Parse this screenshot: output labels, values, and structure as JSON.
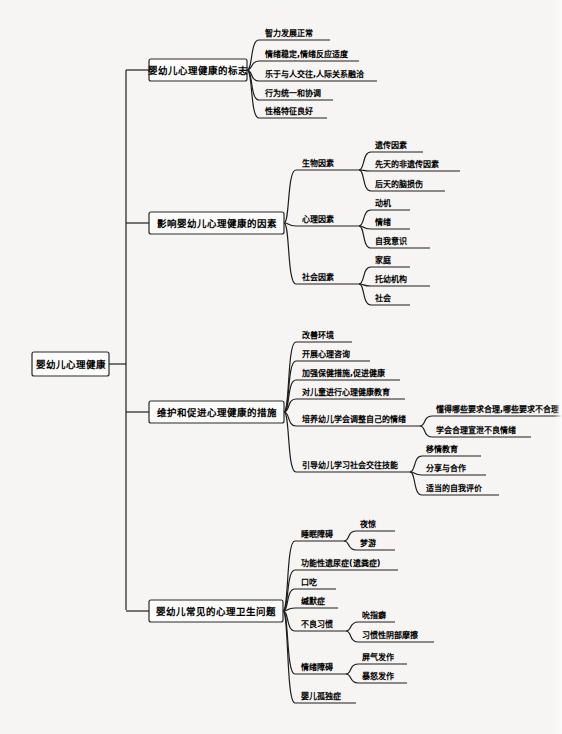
{
  "mindmap": {
    "root": {
      "label": "婴幼儿心理健康",
      "x": 32,
      "y": 352,
      "w": 77,
      "h": 24
    },
    "spine": {
      "x": 126,
      "y1": 70,
      "y2": 610
    },
    "branches": [
      {
        "label": "婴幼儿心理健康的标志",
        "box": {
          "x": 149,
          "y": 59,
          "w": 98,
          "h": 22
        },
        "children": [
          {
            "label": "智力发展正常",
            "y": 40,
            "w": 65
          },
          {
            "label": "情绪稳定,情绪反应适度",
            "y": 61,
            "w": 94
          },
          {
            "label": "乐于与人交往,人际关系融洽",
            "y": 81,
            "w": 112
          },
          {
            "label": "行为统一和协调",
            "y": 100,
            "w": 68
          },
          {
            "label": "性格特征良好",
            "y": 118,
            "w": 62
          }
        ]
      },
      {
        "label": "影响婴幼儿心理健康的因素",
        "box": {
          "x": 149,
          "y": 212,
          "w": 135,
          "h": 22
        },
        "children": [
          {
            "label": "生物因素",
            "y": 170,
            "w": 57,
            "children": [
              {
                "label": "遗传因素",
                "y": 152,
                "w": 48
              },
              {
                "label": "先天的非遗传因素",
                "y": 171,
                "w": 85
              },
              {
                "label": "后天的脑损伤",
                "y": 191,
                "w": 70
              }
            ]
          },
          {
            "label": "心理因素",
            "y": 226,
            "w": 57,
            "children": [
              {
                "label": "动机",
                "y": 210,
                "w": 35
              },
              {
                "label": "情绪",
                "y": 229,
                "w": 35
              },
              {
                "label": "自我意识",
                "y": 248,
                "w": 55
              }
            ]
          },
          {
            "label": "社会因素",
            "y": 284,
            "w": 57,
            "children": [
              {
                "label": "家庭",
                "y": 267,
                "w": 35
              },
              {
                "label": "托幼机构",
                "y": 286,
                "w": 55
              },
              {
                "label": "社会",
                "y": 305,
                "w": 35
              }
            ]
          }
        ]
      },
      {
        "label": "维护和促进心理健康的措施",
        "box": {
          "x": 149,
          "y": 401,
          "w": 135,
          "h": 22
        },
        "children": [
          {
            "label": "改善环境",
            "y": 342,
            "w": 50
          },
          {
            "label": "开展心理咨询",
            "y": 361,
            "w": 68
          },
          {
            "label": "加强保健措施,促进健康",
            "y": 380,
            "w": 98
          },
          {
            "label": "对儿童进行心理健康教育",
            "y": 399,
            "w": 103
          },
          {
            "label": "培养幼儿学会调整自己的情绪",
            "y": 426,
            "w": 118,
            "children": [
              {
                "label": "懂得哪些要求合理,哪些要求不合理",
                "y": 416,
                "w": 128
              },
              {
                "label": "学会合理宣泄不良情绪",
                "y": 437,
                "w": 95
              }
            ]
          },
          {
            "label": "引导幼儿学习社会交往技能",
            "y": 472,
            "w": 108,
            "children": [
              {
                "label": "移情教育",
                "y": 456,
                "w": 55
              },
              {
                "label": "分享与合作",
                "y": 475,
                "w": 60
              },
              {
                "label": "适当的自我评价",
                "y": 495,
                "w": 73
              }
            ]
          }
        ]
      },
      {
        "label": "婴幼儿常见的心理卫生问题",
        "box": {
          "x": 149,
          "y": 600,
          "w": 134,
          "h": 22
        },
        "children": [
          {
            "label": "睡眠障碍",
            "y": 541,
            "w": 43,
            "children": [
              {
                "label": "夜惊",
                "y": 531,
                "w": 35
              },
              {
                "label": "梦游",
                "y": 550,
                "w": 35
              }
            ]
          },
          {
            "label": "功能性遗尿症(遗粪症)",
            "y": 570,
            "w": 97
          },
          {
            "label": "口吃",
            "y": 589,
            "w": 35
          },
          {
            "label": "缄默症",
            "y": 608,
            "w": 37
          },
          {
            "label": "不良习惯",
            "y": 631,
            "w": 45,
            "children": [
              {
                "label": "吮指癖",
                "y": 622,
                "w": 33
              },
              {
                "label": "习惯性阴部摩擦",
                "y": 642,
                "w": 72
              }
            ]
          },
          {
            "label": "情绪障碍",
            "y": 674,
            "w": 45,
            "children": [
              {
                "label": "屏气发作",
                "y": 664,
                "w": 45
              },
              {
                "label": "暴怒发作",
                "y": 683,
                "w": 45
              }
            ]
          },
          {
            "label": "婴儿孤独症",
            "y": 703,
            "w": 55
          }
        ]
      }
    ]
  },
  "colors": {
    "background": "#f6f5f3",
    "line": "#1e1e1e",
    "box_fill": "#fbfbfa"
  }
}
